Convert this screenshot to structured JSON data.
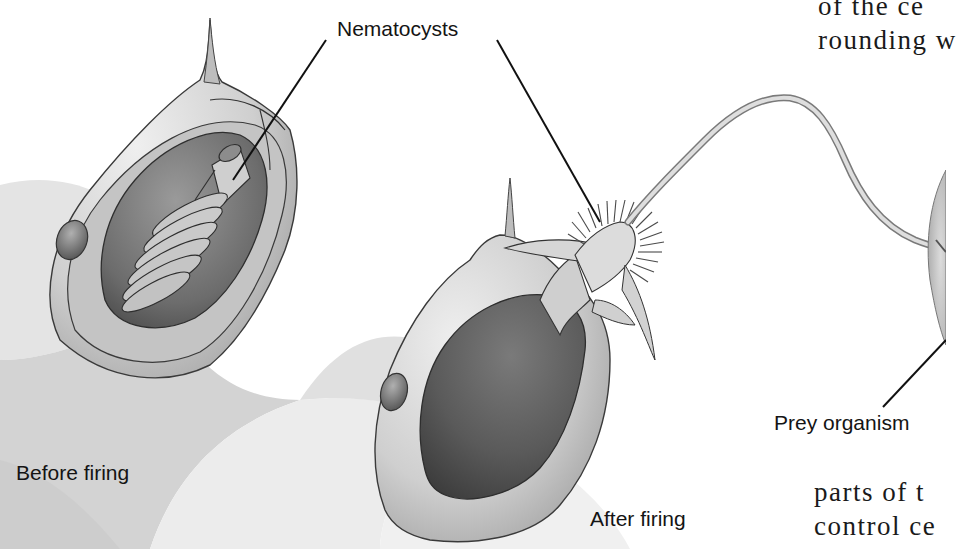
{
  "figure": {
    "labels": {
      "nematocysts": "Nematocysts",
      "prey_organism": "Prey organism",
      "before_firing": "Before firing",
      "after_firing": "After firing"
    },
    "panels": [
      {
        "name": "before-firing",
        "description": "Cnidocyte with coiled thread inside capsule, trigger spine on top"
      },
      {
        "name": "after-firing",
        "description": "Discharged capsule with everted barbed thread extending to prey"
      }
    ],
    "colors": {
      "background": "#ffffff",
      "ink": "#141414",
      "cell_light": "#d9d9d9",
      "cell_mid": "#a8a8a8",
      "cell_dark": "#5e5e5e"
    }
  },
  "page_text": {
    "top_right_line1": "of the ce",
    "top_right_line2": "rounding w",
    "bottom_right_line1": "parts of t",
    "bottom_right_line2": "control ce"
  }
}
